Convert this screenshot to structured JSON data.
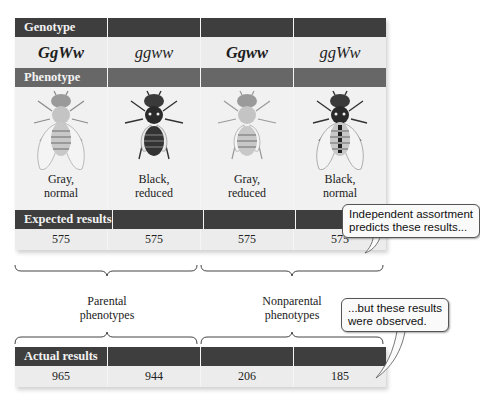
{
  "table": {
    "genotype_header": "Genotype",
    "genotypes": [
      "GgWw",
      "ggww",
      "Ggww",
      "ggWw"
    ],
    "phenotype_header": "Phenotype",
    "phenotypes": [
      {
        "line1": "Gray,",
        "line2": "normal",
        "body_color": "gray",
        "wings": "normal"
      },
      {
        "line1": "Black,",
        "line2": "reduced",
        "body_color": "black",
        "wings": "reduced"
      },
      {
        "line1": "Gray,",
        "line2": "reduced",
        "body_color": "gray",
        "wings": "reduced"
      },
      {
        "line1": "Black,",
        "line2": "normal",
        "body_color": "black",
        "wings": "normal"
      }
    ],
    "expected_header": "Expected results",
    "expected_values": [
      "575",
      "575",
      "575",
      "575"
    ],
    "actual_header": "Actual results",
    "actual_values": [
      "965",
      "944",
      "206",
      "185"
    ]
  },
  "groups": {
    "parental": {
      "line1": "Parental",
      "line2": "phenotypes"
    },
    "nonparental": {
      "line1": "Nonparental",
      "line2": "phenotypes"
    }
  },
  "callouts": {
    "expected": {
      "line1": "Independent assortment",
      "line2": "predicts these results..."
    },
    "actual": {
      "line1": "...but these results",
      "line2": "were observed."
    }
  },
  "colors": {
    "header_dark": "#3e3e3e",
    "header_mid": "#676767",
    "cell_bg": "#ececec",
    "fly_cell_bg": "#f1f1f1"
  }
}
